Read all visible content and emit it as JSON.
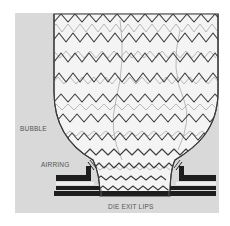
{
  "diagram": {
    "labels": {
      "bubble": "BUBBLE",
      "airring": "AIRRING",
      "die_exit_lips": "DIE EXIT LIPS"
    },
    "colors": {
      "background": "#ffffff",
      "panel": "#d9d9d9",
      "bubble_fill": "#f4f4f4",
      "outline": "#3a3a3a",
      "wave_dark": "#3c3c3c",
      "wave_light": "#a8a8a8",
      "die_block": "#1e1e1e",
      "label": "#555555"
    },
    "elements": [
      "panel",
      "bubble",
      "wavy-film-lines",
      "airring-left",
      "airring-right",
      "die-exit-lips"
    ]
  }
}
